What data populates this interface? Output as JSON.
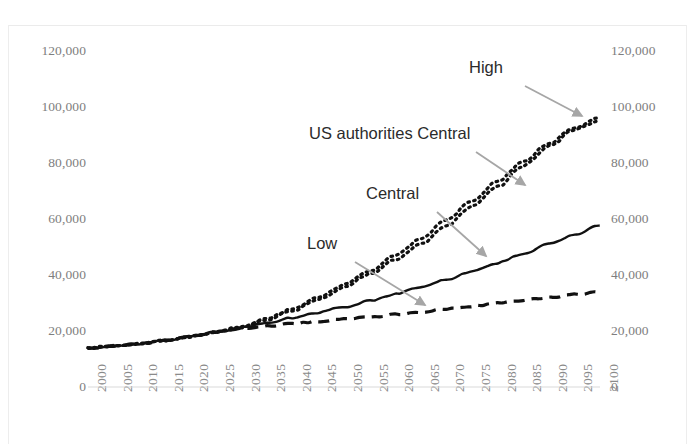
{
  "chart_data": {
    "type": "line",
    "title": "",
    "xlabel": "",
    "ylabel": "",
    "xlim": [
      2000,
      2100
    ],
    "ylim": [
      0,
      120000
    ],
    "grid": false,
    "legend_position": "inline-annotations",
    "y_ticks": [
      "0",
      "20,000",
      "40,000",
      "60,000",
      "80,000",
      "100,000",
      "120,000"
    ],
    "y_tick_values": [
      0,
      20000,
      40000,
      60000,
      80000,
      100000,
      120000
    ],
    "dual_y_axis": true,
    "x_ticks": [
      "2000",
      "2005",
      "2010",
      "2015",
      "2020",
      "2025",
      "2030",
      "2035",
      "2040",
      "2045",
      "2050",
      "2055",
      "2060",
      "2065",
      "2070",
      "2075",
      "2080",
      "2085",
      "2090",
      "2095",
      "2100"
    ],
    "x_tick_values": [
      2000,
      2005,
      2010,
      2015,
      2020,
      2025,
      2030,
      2035,
      2040,
      2045,
      2050,
      2055,
      2060,
      2065,
      2070,
      2075,
      2080,
      2085,
      2090,
      2095,
      2100
    ],
    "x": [
      2000,
      2005,
      2010,
      2015,
      2020,
      2025,
      2030,
      2035,
      2040,
      2045,
      2050,
      2055,
      2060,
      2065,
      2070,
      2075,
      2080,
      2085,
      2090,
      2095,
      2100
    ],
    "series": [
      {
        "name": "High",
        "style": "dotted",
        "color": "#111111",
        "values": [
          13900,
          14600,
          15400,
          16600,
          18000,
          19600,
          21600,
          24500,
          28000,
          32000,
          36500,
          41500,
          47000,
          53000,
          59500,
          66500,
          73500,
          80500,
          87000,
          92500,
          96200
        ]
      },
      {
        "name": "US authorities Central",
        "style": "dotted",
        "color": "#111111",
        "values": [
          13900,
          14600,
          15400,
          16600,
          18000,
          19600,
          21300,
          24000,
          27300,
          31200,
          35500,
          40300,
          45500,
          51200,
          57500,
          64500,
          71500,
          79000,
          86000,
          92000,
          95300
        ]
      },
      {
        "name": "Central",
        "style": "solid",
        "color": "#111111",
        "values": [
          13900,
          14600,
          15400,
          16600,
          18000,
          19600,
          21200,
          22900,
          24700,
          26600,
          28600,
          30800,
          33100,
          35600,
          38300,
          41200,
          44300,
          47600,
          51000,
          54400,
          57800
        ]
      },
      {
        "name": "Low",
        "style": "dashed",
        "color": "#111111",
        "values": [
          13900,
          14600,
          15400,
          16600,
          18000,
          19600,
          20900,
          21800,
          22600,
          23400,
          24200,
          25000,
          25900,
          26800,
          27800,
          28800,
          29900,
          31000,
          32000,
          33000,
          33900
        ]
      }
    ],
    "annotations": [
      {
        "label": "High",
        "text_x": 510,
        "text_y": 70,
        "arrow_from_x": 525,
        "arrow_from_y": 86,
        "arrow_to_x": 582,
        "arrow_to_y": 116
      },
      {
        "label": "US authorities Central",
        "text_x": 403,
        "text_y": 136,
        "arrow_from_x": 476,
        "arrow_from_y": 152,
        "arrow_to_x": 525,
        "arrow_to_y": 185
      },
      {
        "label": "Central",
        "text_x": 403,
        "text_y": 196,
        "arrow_from_x": 437,
        "arrow_from_y": 212,
        "arrow_to_x": 486,
        "arrow_to_y": 256
      },
      {
        "label": "Low",
        "text_x": 329,
        "text_y": 246,
        "arrow_from_x": 355,
        "arrow_from_y": 262,
        "arrow_to_x": 425,
        "arrow_to_y": 305
      }
    ],
    "arrow_color": "#a6a6a6",
    "axis_color": "#d9d9d9"
  },
  "axis": {
    "left_labels": [
      "120,000",
      "100,000",
      "80,000",
      "60,000",
      "40,000",
      "20,000",
      "0"
    ],
    "right_labels": [
      "120,000",
      "100,000",
      "80,000",
      "60,000",
      "40,000",
      "20,000",
      "0"
    ]
  },
  "annotation_labels": {
    "high": "High",
    "us_authorities_central": "US authorities Central",
    "central": "Central",
    "low": "Low"
  }
}
